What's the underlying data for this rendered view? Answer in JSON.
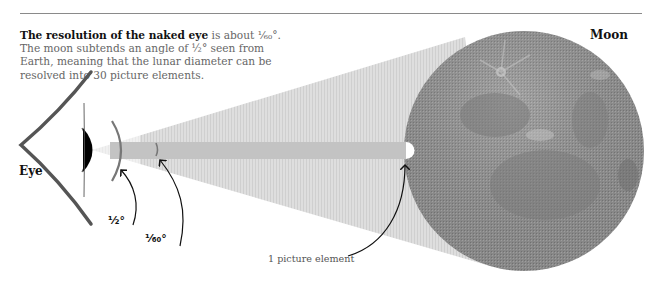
{
  "header": {
    "cut_off_text": "… y … … … … …",
    "rule_color": "#8a8a8a"
  },
  "intro": {
    "bold": "The resolution of the naked eye",
    "rest": " is about ¹⁄₆₀°. The moon subtends an angle of ½° seen from Earth, meaning that the lunar diameter can be resolved into 30 picture elements."
  },
  "labels": {
    "eye": "Eye",
    "moon": "Moon",
    "half_degree": "½°",
    "sixtieth_degree": "¹⁄₆₀°",
    "picture_element": "1 picture element"
  },
  "colors": {
    "cone_fill": "#d9d9d9",
    "beam_fill": "#c2c2c2",
    "moon_base": "#8e8e8e",
    "moon_highlight": "#c8c8c8",
    "eye_outline": "#555555",
    "pupil": "#000000",
    "arc_gray": "#7a7a7a"
  },
  "geometry": {
    "moon_center": [
      524,
      151
    ],
    "moon_radius": 120,
    "resolution_ratio": "1/30 of lunar diameter"
  }
}
